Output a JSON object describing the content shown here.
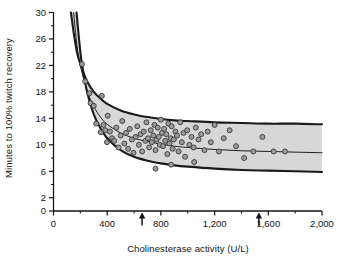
{
  "chart_data": {
    "type": "scatter",
    "title": "",
    "xlabel": "Cholinesterase activity (U/L)",
    "ylabel": "Minutes to 100% twitch recovery",
    "xlim": [
      0,
      2000
    ],
    "ylim": [
      0,
      30
    ],
    "grid": false,
    "legend": null,
    "x_ticks": [
      0,
      400,
      800,
      1200,
      1600,
      2000
    ],
    "x_tick_labels": [
      "0",
      "400",
      "800",
      "1,200",
      "1,600",
      "2,000"
    ],
    "x_minor_ticks": [
      200,
      600,
      1000,
      1400,
      1800
    ],
    "y_ticks": [
      0,
      2,
      6,
      10,
      14,
      18,
      22,
      26,
      30
    ],
    "y_tick_labels": [
      "0",
      "2",
      "6",
      "10",
      "14",
      "18",
      "22",
      "26",
      "30"
    ],
    "y_minor_ticks": [
      4,
      8,
      12,
      16,
      20,
      24,
      28
    ],
    "annotations": [
      {
        "name": "arrow-lower-reference",
        "x": 660,
        "y": 0,
        "symbol": "up-arrow"
      },
      {
        "name": "arrow-upper-reference",
        "x": 1530,
        "y": 0,
        "symbol": "up-arrow"
      }
    ],
    "band": {
      "name": "confidence-band",
      "fill": "#d9d9d9",
      "stroke": "#1a1a1a",
      "description": "95% confidence band around fitted hyperbolic curve"
    },
    "fit_curve": {
      "name": "fitted-regression-curve",
      "stroke": "#1a1a1a",
      "model": "y = a/x + b",
      "points": [
        {
          "x": 150,
          "y": 30.0
        },
        {
          "x": 175,
          "y": 25.0
        },
        {
          "x": 200,
          "y": 22.0
        },
        {
          "x": 250,
          "y": 18.2
        },
        {
          "x": 300,
          "y": 15.8
        },
        {
          "x": 350,
          "y": 14.2
        },
        {
          "x": 400,
          "y": 13.1
        },
        {
          "x": 500,
          "y": 11.8
        },
        {
          "x": 600,
          "y": 11.0
        },
        {
          "x": 700,
          "y": 10.5
        },
        {
          "x": 800,
          "y": 10.1
        },
        {
          "x": 900,
          "y": 9.8
        },
        {
          "x": 1000,
          "y": 9.6
        },
        {
          "x": 1200,
          "y": 9.3
        },
        {
          "x": 1400,
          "y": 9.1
        },
        {
          "x": 1600,
          "y": 9.0
        },
        {
          "x": 1800,
          "y": 8.9
        },
        {
          "x": 2000,
          "y": 8.8
        }
      ]
    },
    "upper_bound": {
      "name": "upper-confidence-bound",
      "points": [
        {
          "x": 130,
          "y": 30.0
        },
        {
          "x": 150,
          "y": 27.0
        },
        {
          "x": 175,
          "y": 24.0
        },
        {
          "x": 200,
          "y": 22.2
        },
        {
          "x": 250,
          "y": 19.6
        },
        {
          "x": 300,
          "y": 18.0
        },
        {
          "x": 350,
          "y": 17.0
        },
        {
          "x": 400,
          "y": 16.2
        },
        {
          "x": 500,
          "y": 15.2
        },
        {
          "x": 600,
          "y": 14.6
        },
        {
          "x": 700,
          "y": 14.2
        },
        {
          "x": 800,
          "y": 13.9
        },
        {
          "x": 900,
          "y": 13.7
        },
        {
          "x": 1000,
          "y": 13.6
        },
        {
          "x": 1200,
          "y": 13.4
        },
        {
          "x": 1400,
          "y": 13.3
        },
        {
          "x": 1600,
          "y": 13.2
        },
        {
          "x": 1800,
          "y": 13.2
        },
        {
          "x": 2000,
          "y": 13.1
        }
      ]
    },
    "lower_bound": {
      "name": "lower-confidence-bound",
      "points": [
        {
          "x": 172,
          "y": 30.0
        },
        {
          "x": 190,
          "y": 26.0
        },
        {
          "x": 210,
          "y": 22.5
        },
        {
          "x": 250,
          "y": 18.0
        },
        {
          "x": 300,
          "y": 14.6
        },
        {
          "x": 350,
          "y": 12.5
        },
        {
          "x": 400,
          "y": 11.0
        },
        {
          "x": 500,
          "y": 9.2
        },
        {
          "x": 600,
          "y": 8.2
        },
        {
          "x": 700,
          "y": 7.6
        },
        {
          "x": 800,
          "y": 7.2
        },
        {
          "x": 900,
          "y": 6.9
        },
        {
          "x": 1000,
          "y": 6.7
        },
        {
          "x": 1200,
          "y": 6.4
        },
        {
          "x": 1400,
          "y": 6.2
        },
        {
          "x": 1600,
          "y": 6.1
        },
        {
          "x": 1800,
          "y": 6.0
        },
        {
          "x": 2000,
          "y": 5.9
        }
      ]
    },
    "points": [
      {
        "x": 212,
        "y": 22.2
      },
      {
        "x": 268,
        "y": 17.8
      },
      {
        "x": 276,
        "y": 16.3
      },
      {
        "x": 300,
        "y": 15.9
      },
      {
        "x": 318,
        "y": 13.2
      },
      {
        "x": 352,
        "y": 11.9
      },
      {
        "x": 360,
        "y": 17.4
      },
      {
        "x": 372,
        "y": 13.0
      },
      {
        "x": 386,
        "y": 12.2
      },
      {
        "x": 398,
        "y": 10.4
      },
      {
        "x": 404,
        "y": 14.4
      },
      {
        "x": 420,
        "y": 12.0
      },
      {
        "x": 436,
        "y": 11.0
      },
      {
        "x": 452,
        "y": 10.6
      },
      {
        "x": 468,
        "y": 12.6
      },
      {
        "x": 484,
        "y": 9.6
      },
      {
        "x": 500,
        "y": 11.4
      },
      {
        "x": 512,
        "y": 13.6
      },
      {
        "x": 528,
        "y": 10.2
      },
      {
        "x": 540,
        "y": 11.8
      },
      {
        "x": 556,
        "y": 9.4
      },
      {
        "x": 568,
        "y": 12.4
      },
      {
        "x": 584,
        "y": 10.8
      },
      {
        "x": 596,
        "y": 8.8
      },
      {
        "x": 612,
        "y": 11.2
      },
      {
        "x": 624,
        "y": 12.8
      },
      {
        "x": 636,
        "y": 10.0
      },
      {
        "x": 648,
        "y": 11.6
      },
      {
        "x": 660,
        "y": 9.0
      },
      {
        "x": 672,
        "y": 12.0
      },
      {
        "x": 684,
        "y": 10.6
      },
      {
        "x": 692,
        "y": 13.4
      },
      {
        "x": 704,
        "y": 11.0
      },
      {
        "x": 712,
        "y": 9.6
      },
      {
        "x": 724,
        "y": 12.2
      },
      {
        "x": 732,
        "y": 10.4
      },
      {
        "x": 744,
        "y": 11.4
      },
      {
        "x": 752,
        "y": 13.0
      },
      {
        "x": 760,
        "y": 9.2
      },
      {
        "x": 768,
        "y": 10.8
      },
      {
        "x": 776,
        "y": 12.6
      },
      {
        "x": 784,
        "y": 11.2
      },
      {
        "x": 792,
        "y": 10.0
      },
      {
        "x": 800,
        "y": 13.8
      },
      {
        "x": 808,
        "y": 11.8
      },
      {
        "x": 816,
        "y": 9.8
      },
      {
        "x": 824,
        "y": 12.4
      },
      {
        "x": 832,
        "y": 10.6
      },
      {
        "x": 840,
        "y": 11.6
      },
      {
        "x": 848,
        "y": 8.6
      },
      {
        "x": 856,
        "y": 13.2
      },
      {
        "x": 864,
        "y": 10.2
      },
      {
        "x": 872,
        "y": 11.0
      },
      {
        "x": 880,
        "y": 12.8
      },
      {
        "x": 888,
        "y": 9.4
      },
      {
        "x": 896,
        "y": 10.8
      },
      {
        "x": 908,
        "y": 12.0
      },
      {
        "x": 920,
        "y": 11.4
      },
      {
        "x": 932,
        "y": 9.0
      },
      {
        "x": 944,
        "y": 13.4
      },
      {
        "x": 956,
        "y": 10.4
      },
      {
        "x": 968,
        "y": 11.8
      },
      {
        "x": 980,
        "y": 8.2
      },
      {
        "x": 996,
        "y": 12.2
      },
      {
        "x": 1012,
        "y": 10.0
      },
      {
        "x": 1028,
        "y": 11.2
      },
      {
        "x": 1044,
        "y": 9.6
      },
      {
        "x": 1060,
        "y": 12.6
      },
      {
        "x": 1080,
        "y": 10.8
      },
      {
        "x": 1100,
        "y": 11.6
      },
      {
        "x": 1124,
        "y": 9.2
      },
      {
        "x": 1148,
        "y": 12.0
      },
      {
        "x": 1172,
        "y": 10.4
      },
      {
        "x": 1200,
        "y": 13.0
      },
      {
        "x": 1232,
        "y": 9.0
      },
      {
        "x": 1268,
        "y": 11.0
      },
      {
        "x": 1312,
        "y": 12.2
      },
      {
        "x": 1360,
        "y": 9.8
      },
      {
        "x": 1420,
        "y": 8.0
      },
      {
        "x": 1488,
        "y": 9.0
      },
      {
        "x": 1556,
        "y": 11.2
      },
      {
        "x": 1640,
        "y": 9.0
      },
      {
        "x": 1724,
        "y": 9.0
      },
      {
        "x": 760,
        "y": 6.4
      },
      {
        "x": 876,
        "y": 7.0
      },
      {
        "x": 1048,
        "y": 7.4
      },
      {
        "x": 236,
        "y": 19.6
      }
    ]
  }
}
